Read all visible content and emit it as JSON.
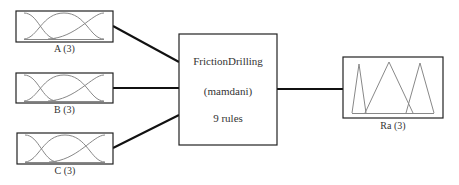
{
  "diagram": {
    "type": "fuzzy-inference-system",
    "inputs": [
      {
        "name": "A",
        "label": "A (3)",
        "mf_count": 3,
        "mf_shape": "gaussian"
      },
      {
        "name": "B",
        "label": "B (3)",
        "mf_count": 3,
        "mf_shape": "gaussian"
      },
      {
        "name": "C",
        "label": "C (3)",
        "mf_count": 3,
        "mf_shape": "gaussian"
      }
    ],
    "system": {
      "name": "FrictionDrilling",
      "method": "(mamdani)",
      "rules": "9 rules"
    },
    "output": {
      "name": "Ra",
      "label": "Ra (3)",
      "mf_count": 3,
      "mf_shape": "triangular"
    },
    "colors": {
      "box_border": "#222222",
      "connector": "#111111",
      "mf_curve": "#888888",
      "text": "#333333"
    }
  }
}
